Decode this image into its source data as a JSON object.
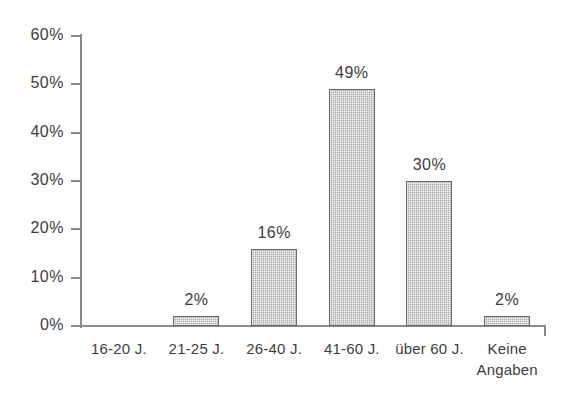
{
  "title_remnant": "",
  "chart_data": {
    "type": "bar",
    "title": "",
    "subtitle": "",
    "xlabel": "",
    "ylabel": "",
    "categories": [
      "16-20 J.",
      "21-25 J.",
      "26-40 J.",
      "41-60 J.",
      "über 60 J.",
      "Keine Angaben"
    ],
    "category_lines": [
      [
        "16-20 J."
      ],
      [
        "21-25 J."
      ],
      [
        "26-40 J."
      ],
      [
        "41-60 J."
      ],
      [
        "über 60 J."
      ],
      [
        "Keine",
        "Angaben"
      ]
    ],
    "values": [
      0,
      2,
      16,
      49,
      30,
      2
    ],
    "data_labels": [
      "",
      "2%",
      "16%",
      "49%",
      "30%",
      "2%"
    ],
    "ylim": [
      0,
      60
    ],
    "yticks": [
      0,
      10,
      20,
      30,
      40,
      50,
      60
    ],
    "ytick_labels": [
      "0%",
      "10%",
      "20%",
      "30%",
      "40%",
      "50%",
      "60%"
    ],
    "grid": false,
    "legend": false,
    "legend_position": "none",
    "bar_fill_color": "#a9a9a9",
    "bar_border_color": "#6b6b6b",
    "axis_color": "#8a8a8a",
    "text_color": "#3d3d3d",
    "background_color": "#ffffff",
    "value_unit": "%"
  }
}
